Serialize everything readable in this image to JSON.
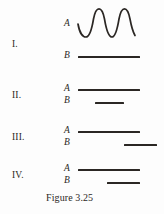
{
  "figure": {
    "caption": "Figure 3.25",
    "ink_color": "#2b2724",
    "background_color": "#fdfdfd",
    "rows": [
      {
        "numeral": "I.",
        "signals": [
          {
            "label": "A",
            "kind": "wave",
            "cycles": 2.5,
            "x_start": 78,
            "x_end": 140
          },
          {
            "label": "B",
            "kind": "line",
            "x_start": 78,
            "x_end": 140
          }
        ]
      },
      {
        "numeral": "II.",
        "signals": [
          {
            "label": "A",
            "kind": "line",
            "x_start": 78,
            "x_end": 140
          },
          {
            "label": "B",
            "kind": "line",
            "x_start": 95,
            "x_end": 124
          }
        ]
      },
      {
        "numeral": "III.",
        "signals": [
          {
            "label": "A",
            "kind": "line",
            "x_start": 78,
            "x_end": 140
          },
          {
            "label": "B",
            "kind": "line",
            "x_start": 124,
            "x_end": 157
          }
        ]
      },
      {
        "numeral": "IV.",
        "signals": [
          {
            "label": "A",
            "kind": "line",
            "x_start": 78,
            "x_end": 140
          },
          {
            "label": "B",
            "kind": "line",
            "x_start": 107,
            "x_end": 140
          }
        ]
      }
    ]
  }
}
